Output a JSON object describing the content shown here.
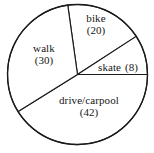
{
  "chart_data": {
    "type": "pie",
    "title": "",
    "subtitle": "",
    "xlabel": "",
    "ylabel": "",
    "legend_position": "none",
    "grid": false,
    "total": 100,
    "units": "count",
    "label_format": "name (value)",
    "categories": [
      "bike",
      "skate",
      "drive/carpool",
      "walk"
    ],
    "values": [
      20,
      8,
      42,
      30
    ],
    "slices": [
      {
        "name": "bike",
        "value": 20,
        "value_text": "(20)",
        "percent": 20,
        "start_angle_deg": 33,
        "end_angle_deg": 98,
        "color": "#ffffff",
        "stroke": "#1a1a1a",
        "label_layout": "stacked"
      },
      {
        "name": "skate",
        "value": 8,
        "value_text": "(8)",
        "percent": 8,
        "start_angle_deg": 0,
        "end_angle_deg": 33,
        "color": "#ffffff",
        "stroke": "#1a1a1a",
        "label_layout": "inline"
      },
      {
        "name": "drive/carpool",
        "value": 42,
        "value_text": "(42)",
        "percent": 42,
        "start_angle_deg": 212,
        "end_angle_deg": 360,
        "color": "#ffffff",
        "stroke": "#1a1a1a",
        "label_layout": "stacked"
      },
      {
        "name": "walk",
        "value": 30,
        "value_text": "(30)",
        "percent": 30,
        "start_angle_deg": 98,
        "end_angle_deg": 212,
        "color": "#ffffff",
        "stroke": "#1a1a1a",
        "label_layout": "stacked"
      }
    ],
    "geometry": {
      "center_x": 77.5,
      "center_y": 74.5,
      "radius": 70
    },
    "colors": {
      "background": "#ffffff",
      "outline": "#1a1a1a",
      "text": "#171717"
    }
  }
}
